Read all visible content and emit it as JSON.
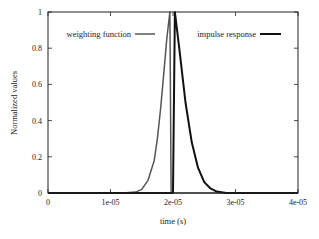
{
  "chart_data": {
    "type": "line",
    "title": "",
    "xlabel": "time (s)",
    "ylabel": "Normalized values",
    "xlim": [
      0,
      4e-05
    ],
    "ylim": [
      0,
      1
    ],
    "grid": false,
    "legend_position": "inside-top",
    "x_ticks": [
      "0",
      "1e-05",
      "2e-05",
      "3e-05",
      "4e-05"
    ],
    "y_ticks": [
      "0",
      "0.2",
      "0.4",
      "0.6",
      "0.8",
      "1"
    ],
    "series": [
      {
        "name": "weighting function",
        "color": "#555555",
        "points": [
          [
            0,
            0
          ],
          [
            1.2e-05,
            0
          ],
          [
            1.4e-05,
            0.005
          ],
          [
            1.5e-05,
            0.02
          ],
          [
            1.6e-05,
            0.07
          ],
          [
            1.7e-05,
            0.18
          ],
          [
            1.75e-05,
            0.3
          ],
          [
            1.8e-05,
            0.46
          ],
          [
            1.85e-05,
            0.65
          ],
          [
            1.9e-05,
            0.85
          ],
          [
            1.95e-05,
            1.0
          ],
          [
            1.97e-05,
            0
          ],
          [
            4e-05,
            0
          ]
        ]
      },
      {
        "name": "impulse response",
        "color": "#111111",
        "points": [
          [
            0,
            0
          ],
          [
            2e-05,
            0
          ],
          [
            2.03e-05,
            1.0
          ],
          [
            2.1e-05,
            0.8
          ],
          [
            2.2e-05,
            0.5
          ],
          [
            2.3e-05,
            0.28
          ],
          [
            2.4e-05,
            0.14
          ],
          [
            2.5e-05,
            0.06
          ],
          [
            2.6e-05,
            0.025
          ],
          [
            2.7e-05,
            0.008
          ],
          [
            2.85e-05,
            0
          ],
          [
            4e-05,
            0
          ]
        ]
      }
    ]
  },
  "legend": {
    "items": [
      {
        "label": "weighting function",
        "color": "#555555"
      },
      {
        "label": "impulse response",
        "color": "#111111"
      }
    ]
  }
}
